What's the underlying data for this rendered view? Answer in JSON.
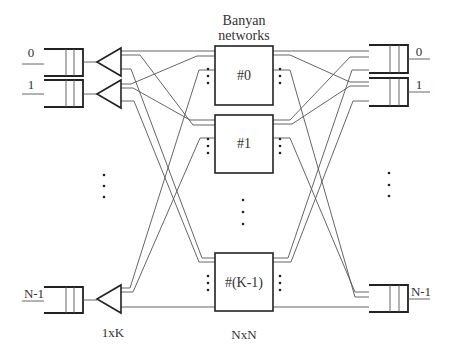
{
  "title": "Banyan networks",
  "title_line1": "Banyan",
  "title_line2": "networks",
  "input_ports": [
    {
      "label": "0"
    },
    {
      "label": "1"
    },
    {
      "label": "N-1"
    }
  ],
  "output_ports": [
    {
      "label": "0"
    },
    {
      "label": "1"
    },
    {
      "label": "N-1"
    }
  ],
  "networks": [
    {
      "label": "#0"
    },
    {
      "label": "#1"
    },
    {
      "label": "#(K-1)"
    }
  ],
  "splitter_label": "1xK",
  "network_size_label": "NxN",
  "colors": {
    "line": "#555555",
    "outline": "#222222",
    "background": "#ffffff"
  }
}
